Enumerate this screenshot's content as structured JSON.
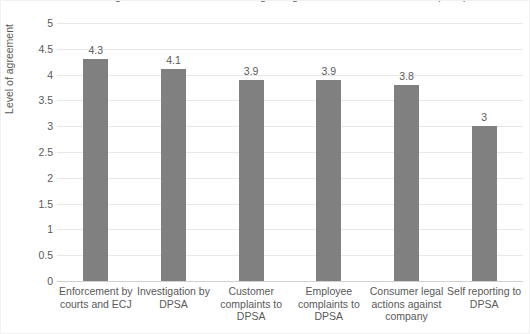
{
  "chart_data": {
    "type": "bar",
    "title": "Level of agreement with statements regarding enforcement mechanisms (n=...)",
    "xlabel": "",
    "ylabel": "Level of agreement",
    "ylim": [
      0,
      5
    ],
    "ystep": 0.5,
    "grid": true,
    "legend": "none",
    "bar_color": "#808080",
    "categories": [
      "Enforcement by courts and ECJ",
      "Investigation by DPSA",
      "Customer complaints to DPSA",
      "Employee complaints to DPSA",
      "Consumer legal actions against company",
      "Self reporting to DPSA"
    ],
    "values": [
      4.3,
      4.1,
      3.9,
      3.9,
      3.8,
      3.0
    ],
    "value_labels": [
      "4.3",
      "4.1",
      "3.9",
      "3.9",
      "3.8",
      "3"
    ],
    "ytick_labels": [
      "5",
      "4.5",
      "4",
      "3.5",
      "3",
      "2.5",
      "2",
      "1.5",
      "1",
      "0.5",
      "0"
    ],
    "ytick_values": [
      5,
      4.5,
      4,
      3.5,
      3,
      2.5,
      2,
      1.5,
      1,
      0.5,
      0
    ]
  }
}
